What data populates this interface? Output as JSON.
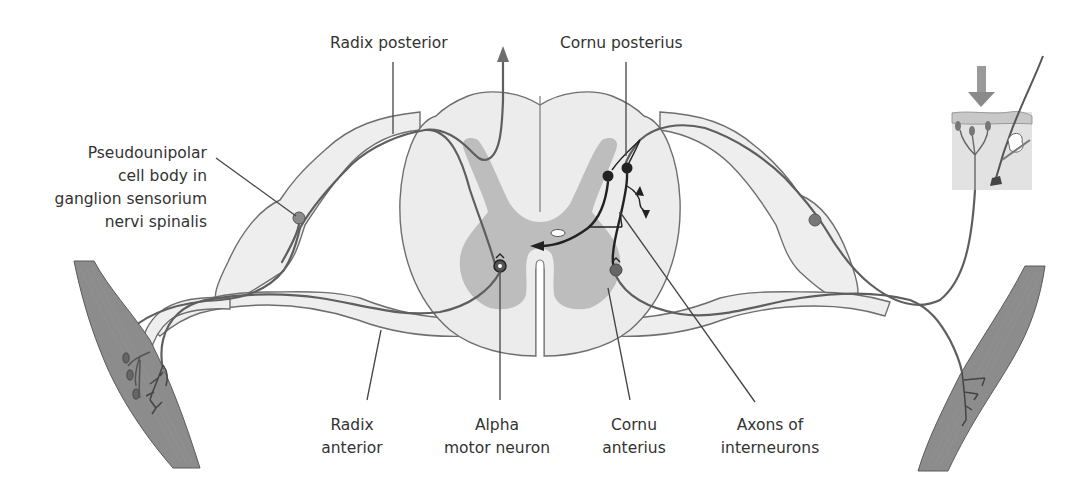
{
  "diagram": {
    "labels": {
      "radix_posterior": "Radix posterior",
      "cornu_posterius": "Cornu posterius",
      "pseudounipolar_line1": "Pseudounipolar",
      "pseudounipolar_line2": "cell body in",
      "pseudounipolar_line3": "ganglion sensorium",
      "pseudounipolar_line4": "nervi spinalis",
      "radix_anterior_line1": "Radix",
      "radix_anterior_line2": "anterior",
      "alpha_motor_line1": "Alpha",
      "alpha_motor_line2": "motor neuron",
      "cornu_anterius_line1": "Cornu",
      "cornu_anterius_line2": "anterius",
      "axons_line1": "Axons of",
      "axons_line2": "interneurons"
    },
    "colors": {
      "white_matter": "#ececec",
      "gray_matter": "#bdbdbd",
      "nerve_fill": "#eeeeee",
      "muscle": "#8c8c8c",
      "skin": "#e2e2e2",
      "neuron_dark": "#222222",
      "neuron_gray": "#777777",
      "stimulus_arrow": "#8a8a8a"
    }
  }
}
